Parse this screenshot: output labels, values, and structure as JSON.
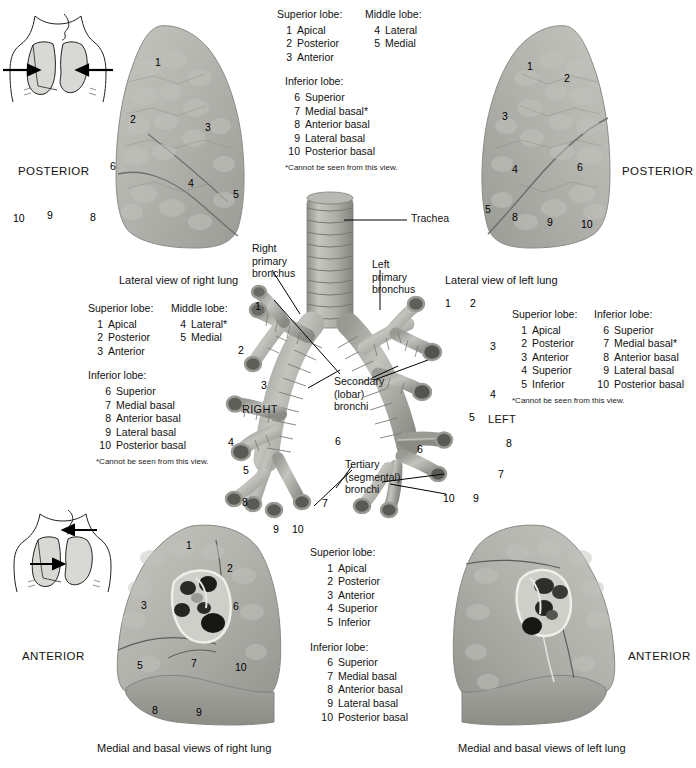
{
  "legends": {
    "top_center": {
      "col1_header": "Superior lobe:",
      "col2_header": "Middle lobe:",
      "col1_items": [
        {
          "num": "1",
          "name": "Apical"
        },
        {
          "num": "2",
          "name": "Posterior"
        },
        {
          "num": "3",
          "name": "Anterior"
        }
      ],
      "col2_items": [
        {
          "num": "4",
          "name": "Lateral"
        },
        {
          "num": "5",
          "name": "Medial"
        }
      ],
      "lower_header": "Inferior lobe:",
      "lower_items": [
        {
          "num": "6",
          "name": "Superior"
        },
        {
          "num": "7",
          "name": "Medial basal*"
        },
        {
          "num": "8",
          "name": "Anterior basal"
        },
        {
          "num": "9",
          "name": "Lateral basal"
        },
        {
          "num": "10",
          "name": "Posterior basal"
        }
      ],
      "footnote": "*Cannot be seen from this view."
    },
    "middle_left": {
      "col1_header": "Superior lobe:",
      "col2_header": "Middle lobe:",
      "col1_items": [
        {
          "num": "1",
          "name": "Apical"
        },
        {
          "num": "2",
          "name": "Posterior"
        },
        {
          "num": "3",
          "name": "Anterior"
        }
      ],
      "col2_items": [
        {
          "num": "4",
          "name": "Lateral*"
        },
        {
          "num": "5",
          "name": "Medial"
        }
      ],
      "lower_header": "Inferior lobe:",
      "lower_items": [
        {
          "num": "6",
          "name": "Superior"
        },
        {
          "num": "7",
          "name": "Medial basal"
        },
        {
          "num": "8",
          "name": "Anterior basal"
        },
        {
          "num": "9",
          "name": "Lateral basal"
        },
        {
          "num": "10",
          "name": "Posterior basal"
        }
      ],
      "footnote": "*Cannot be seen from this view."
    },
    "middle_right": {
      "col1_header": "Superior lobe:",
      "col2_header": "Inferior lobe:",
      "col1_items": [
        {
          "num": "1",
          "name": "Apical"
        },
        {
          "num": "2",
          "name": "Posterior"
        },
        {
          "num": "3",
          "name": "Anterior"
        },
        {
          "num": "4",
          "name": "Superior"
        },
        {
          "num": "5",
          "name": "Inferior"
        }
      ],
      "col2_items": [
        {
          "num": "6",
          "name": "Superior"
        },
        {
          "num": "7",
          "name": "Medial basal*"
        },
        {
          "num": "8",
          "name": "Anterior basal"
        },
        {
          "num": "9",
          "name": "Lateral basal"
        },
        {
          "num": "10",
          "name": "Posterior basal"
        }
      ],
      "footnote": "*Cannot be seen from this view."
    },
    "bottom_center": {
      "col1_header": "Superior lobe:",
      "col1_items": [
        {
          "num": "1",
          "name": "Apical"
        },
        {
          "num": "2",
          "name": "Posterior"
        },
        {
          "num": "3",
          "name": "Anterior"
        },
        {
          "num": "4",
          "name": "Superior"
        },
        {
          "num": "5",
          "name": "Inferior"
        }
      ],
      "lower_header": "Inferior lobe:",
      "lower_items": [
        {
          "num": "6",
          "name": "Superior"
        },
        {
          "num": "7",
          "name": "Medial basal"
        },
        {
          "num": "8",
          "name": "Anterior basal"
        },
        {
          "num": "9",
          "name": "Lateral basal"
        },
        {
          "num": "10",
          "name": "Posterior basal"
        }
      ]
    }
  },
  "captions": {
    "lateral_right": "Lateral view of right lung",
    "lateral_left": "Lateral view of left lung",
    "medial_right": "Medial and basal views of right lung",
    "medial_left": "Medial and basal views of left lung"
  },
  "orientations": {
    "top_left": "POSTERIOR",
    "top_right": "POSTERIOR",
    "bottom_left": "ANTERIOR",
    "bottom_right": "ANTERIOR"
  },
  "bronchial_tree": {
    "trachea": "Trachea",
    "right_primary_bronchus": "Right\nprimary\nbronchus",
    "right_primary_bronchus_lines": [
      "Right",
      "primary",
      "bronchus"
    ],
    "left_primary_bronchus_lines": [
      "Left",
      "primary",
      "bronchus"
    ],
    "secondary_lines": [
      "Secondary",
      "(lobar)",
      "bronchi"
    ],
    "tertiary_lines": [
      "Tertiary",
      "(segmental)",
      "bronchi"
    ],
    "side_right": "RIGHT",
    "side_left": "LEFT",
    "right_numbers": [
      "1",
      "2",
      "3",
      "4",
      "5",
      "6",
      "7",
      "8",
      "9",
      "10"
    ],
    "left_numbers": [
      "1",
      "2",
      "3",
      "4",
      "5",
      "6",
      "7",
      "8",
      "9",
      "10"
    ]
  },
  "segment_numbers": {
    "lateral_right_lung": [
      "1",
      "2",
      "3",
      "6",
      "4",
      "5",
      "10",
      "9",
      "8"
    ],
    "lateral_left_lung": [
      "1",
      "2",
      "3",
      "4",
      "6",
      "5",
      "8",
      "9",
      "10"
    ],
    "medial_right_lung": [
      "1",
      "2",
      "3",
      "6",
      "5",
      "7",
      "10",
      "8",
      "9"
    ]
  },
  "colors": {
    "tissue_light": "#c9c9c4",
    "tissue_mid": "#a9a9a4",
    "tissue_dark": "#8e8e89",
    "cartilage": "#b3b3ae",
    "ink": "#111111",
    "icon_fill": "#d8d8d4"
  }
}
